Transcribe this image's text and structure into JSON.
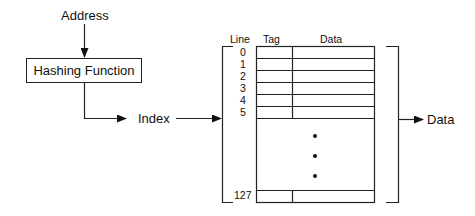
{
  "diagram": {
    "input_label": "Address",
    "hash_box_label": "Hashing Function",
    "index_label": "Index",
    "output_label": "Data",
    "table": {
      "columns": [
        "Line",
        "Tag",
        "Data"
      ],
      "line_numbers": [
        "0",
        "1",
        "2",
        "3",
        "4",
        "5"
      ],
      "last_line_number": "127",
      "ellipsis": [
        "•",
        "•",
        "•"
      ]
    },
    "line_color": "#222222"
  }
}
